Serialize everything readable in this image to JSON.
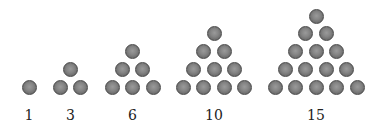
{
  "figure": {
    "ball_color": "#7a7a7a",
    "ball_outline": "#4a4a4a",
    "ball_diameter": 15,
    "h_spacing": 20.5,
    "v_spacing": 17.7,
    "base_y": 87,
    "label_y": 115
  },
  "groups": [
    {
      "label": "1",
      "rows": 1,
      "center_x": 29
    },
    {
      "label": "3",
      "rows": 2,
      "center_x": 70.5
    },
    {
      "label": "6",
      "rows": 3,
      "center_x": 132.5
    },
    {
      "label": "10",
      "rows": 4,
      "center_x": 214
    },
    {
      "label": "15",
      "rows": 5,
      "center_x": 316
    }
  ]
}
